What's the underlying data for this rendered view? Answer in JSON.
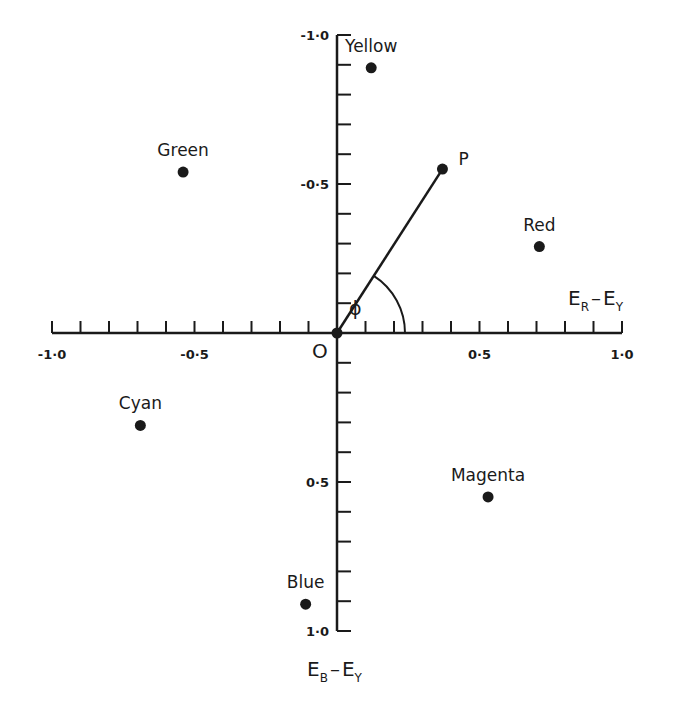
{
  "diagram": {
    "type": "colour-difference vector diagram",
    "origin_label": "O",
    "x_axis": {
      "label_main": "E",
      "label_sub1": "R",
      "label_dash": "–",
      "label_main2": "E",
      "label_sub2": "Y",
      "range": [
        -1.0,
        1.0
      ],
      "tick_step": 0.1,
      "tick_labels": [
        {
          "value": -1.0,
          "text": "-1·0"
        },
        {
          "value": -0.5,
          "text": "-0·5"
        },
        {
          "value": 0.5,
          "text": "0·5"
        },
        {
          "value": 1.0,
          "text": "1·0"
        }
      ]
    },
    "y_axis": {
      "label_main": "E",
      "label_sub1": "B",
      "label_dash": "–",
      "label_main2": "E",
      "label_sub2": "Y",
      "range": [
        -1.0,
        1.0
      ],
      "direction_note": "negative values upward",
      "tick_step": 0.1,
      "tick_labels": [
        {
          "value": -1.0,
          "text": "-1·0"
        },
        {
          "value": -0.5,
          "text": "-0·5"
        },
        {
          "value": 0.5,
          "text": "0·5"
        },
        {
          "value": 1.0,
          "text": "1·0"
        }
      ]
    },
    "points": [
      {
        "name": "Yellow",
        "x": 0.12,
        "y": -0.89
      },
      {
        "name": "Green",
        "x": -0.54,
        "y": -0.54
      },
      {
        "name": "Red",
        "x": 0.71,
        "y": -0.29
      },
      {
        "name": "Cyan",
        "x": -0.69,
        "y": 0.31
      },
      {
        "name": "Magenta",
        "x": 0.53,
        "y": 0.55
      },
      {
        "name": "Blue",
        "x": -0.11,
        "y": 0.91
      }
    ],
    "vector": {
      "label": "P",
      "x": 0.37,
      "y": -0.55
    },
    "angle_label": "ϕ"
  }
}
